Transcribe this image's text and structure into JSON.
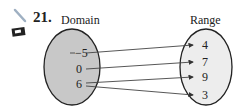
{
  "exercise": {
    "number": "21.",
    "icons": [
      "pencil-icon",
      "calculator-icon"
    ]
  },
  "diagram": {
    "domain_label": "Domain",
    "range_label": "Range",
    "domain_values": [
      "−5",
      "0",
      "6"
    ],
    "range_values": [
      "4",
      "7",
      "9",
      "3"
    ],
    "mappings": [
      {
        "from": "−5",
        "to": "4"
      },
      {
        "from": "0",
        "to": "7"
      },
      {
        "from": "6",
        "to": "9"
      },
      {
        "from": "6",
        "to": "3"
      }
    ],
    "colors": {
      "domain_fill": "#c8c8c8",
      "range_fill": "#ececec",
      "stroke": "#222222",
      "pencil": "#a9b7c6"
    }
  }
}
